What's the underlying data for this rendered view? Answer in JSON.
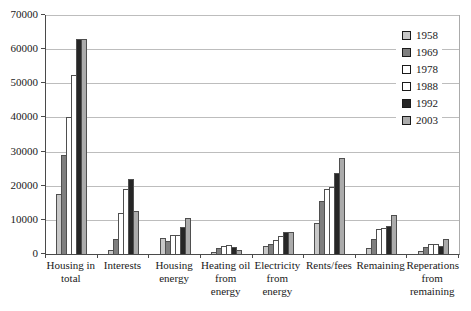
{
  "chart_data": {
    "type": "bar",
    "title": "",
    "xlabel": "",
    "ylabel": "",
    "ylim": [
      0,
      70000
    ],
    "ytick_step": 10000,
    "yticks": [
      "0",
      "10000",
      "20000",
      "30000",
      "40000",
      "50000",
      "60000",
      "70000"
    ],
    "grid": "horizontal",
    "legend_position": "top-right",
    "categories": [
      "Housing in total",
      "Interests",
      "Housing energy",
      "Heating oil from energy",
      "Electricity from energy",
      "Rents/fees",
      "Remaining",
      "Reperations from remaining"
    ],
    "categories_lines": [
      [
        "Housing in",
        "total"
      ],
      [
        "Interests"
      ],
      [
        "Housing",
        "energy"
      ],
      [
        "Heating oil",
        "from",
        "energy"
      ],
      [
        "Electricity",
        "from",
        "energy"
      ],
      [
        "Rents/fees"
      ],
      [
        "Remaining"
      ],
      [
        "Reperations",
        "from",
        "remaining"
      ]
    ],
    "series": [
      {
        "name": "1958",
        "color": "#c8c8c8",
        "values": [
          17500,
          1300,
          4800,
          700,
          2200,
          9000,
          1700,
          1000
        ]
      },
      {
        "name": "1969",
        "color": "#7f7f7f",
        "values": [
          29000,
          4500,
          3800,
          1700,
          2900,
          15500,
          4300,
          2100
        ]
      },
      {
        "name": "1978",
        "color": "#ffffff",
        "values": [
          40000,
          12000,
          5500,
          2400,
          4100,
          19000,
          7200,
          2900
        ]
      },
      {
        "name": "1988",
        "color": "#ffffff",
        "values": [
          52500,
          19000,
          5700,
          2500,
          5400,
          19500,
          7500,
          2900
        ]
      },
      {
        "name": "1992",
        "color": "#262626",
        "values": [
          63000,
          22000,
          7800,
          2000,
          6400,
          23800,
          8200,
          2400
        ]
      },
      {
        "name": "2003",
        "color": "#ababab",
        "values": [
          63000,
          12500,
          10500,
          1300,
          6500,
          28000,
          11500,
          4400
        ]
      }
    ]
  }
}
